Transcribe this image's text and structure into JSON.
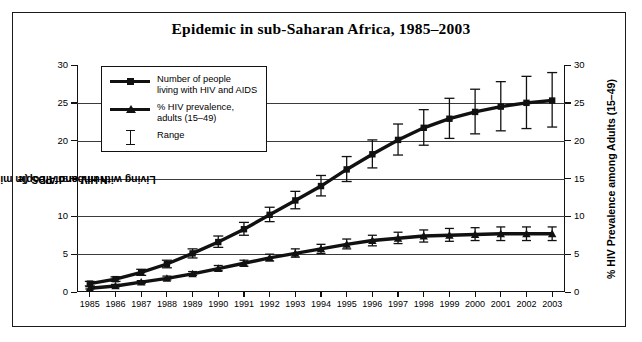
{
  "title": "Epidemic in sub-Saharan Africa, 1985–2003",
  "axes": {
    "left_title_line1": "Number of People",
    "left_title_line2": "Living with HIV and AIDS (in millions)",
    "right_title": "% HIV Prevalence among Adults (15–49)",
    "y_ticks": [
      "0",
      "5",
      "10",
      "15",
      "20",
      "25",
      "30"
    ]
  },
  "legend": {
    "items": [
      {
        "marker": "square-marker-icon",
        "label_line1": "Number of people",
        "label_line2": "living with HIV and AIDS"
      },
      {
        "marker": "triangle-marker-icon",
        "label_line1": "% HIV prevalence,",
        "label_line2": "adults (15–49)"
      },
      {
        "marker": "range-bar-icon",
        "label_line1": "Range",
        "label_line2": ""
      }
    ]
  },
  "colors": {
    "ink": "#111111",
    "grid": "#3b3b3b",
    "background": "#ffffff"
  },
  "chart_data": {
    "type": "line",
    "title": "Epidemic in sub-Saharan Africa, 1985–2003",
    "xlabel": "",
    "ylabel": "Number of People Living with HIV and AIDS (in millions)",
    "y2label": "% HIV Prevalence among Adults (15–49)",
    "ylim": [
      0,
      30
    ],
    "y2lim": [
      0,
      30
    ],
    "grid": true,
    "legend_position": "upper-left-inside",
    "categories": [
      "1985",
      "1986",
      "1987",
      "1988",
      "1989",
      "1990",
      "1991",
      "1992",
      "1993",
      "1994",
      "1995",
      "1996",
      "1997",
      "1998",
      "1999",
      "2000",
      "2001",
      "2002",
      "2003"
    ],
    "series": [
      {
        "name": "Number of people living with HIV and AIDS",
        "axis": "left",
        "unit": "millions",
        "marker": "square",
        "values": [
          1.1,
          1.7,
          2.6,
          3.7,
          5.1,
          6.6,
          8.3,
          10.2,
          12.1,
          14.0,
          16.2,
          18.2,
          20.1,
          21.7,
          22.9,
          23.8,
          24.5,
          25.0,
          25.3
        ],
        "range_low": [
          0.8,
          1.4,
          2.2,
          3.2,
          4.5,
          5.9,
          7.5,
          9.3,
          11.0,
          12.7,
          14.6,
          16.4,
          18.1,
          19.4,
          20.3,
          20.9,
          21.3,
          21.6,
          21.8
        ],
        "range_high": [
          1.4,
          2.0,
          3.0,
          4.2,
          5.7,
          7.4,
          9.2,
          11.2,
          13.3,
          15.4,
          17.9,
          20.1,
          22.2,
          24.1,
          25.6,
          26.8,
          27.8,
          28.5,
          29.0
        ]
      },
      {
        "name": "% HIV prevalence, adults (15–49)",
        "axis": "right",
        "unit": "%",
        "marker": "triangle",
        "values": [
          0.5,
          0.8,
          1.3,
          1.8,
          2.4,
          3.1,
          3.8,
          4.5,
          5.1,
          5.7,
          6.3,
          6.8,
          7.1,
          7.4,
          7.5,
          7.6,
          7.7,
          7.7,
          7.7
        ],
        "range_low": [
          0.4,
          0.7,
          1.1,
          1.6,
          2.2,
          2.8,
          3.4,
          4.1,
          4.6,
          5.1,
          5.7,
          6.1,
          6.4,
          6.6,
          6.7,
          6.8,
          6.8,
          6.8,
          6.8
        ],
        "range_high": [
          0.7,
          1.0,
          1.5,
          2.1,
          2.7,
          3.5,
          4.2,
          5.0,
          5.7,
          6.3,
          7.0,
          7.5,
          7.9,
          8.2,
          8.4,
          8.5,
          8.6,
          8.6,
          8.6
        ]
      }
    ]
  }
}
